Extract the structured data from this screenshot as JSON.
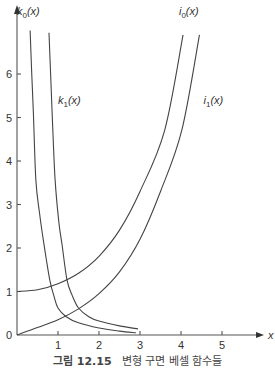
{
  "chart_data": {
    "type": "line",
    "title": "",
    "xlabel": "x",
    "ylabel": "",
    "xlim": [
      0,
      5.9
    ],
    "ylim": [
      0,
      7.2
    ],
    "grid": false,
    "legend": "inline labels",
    "x_ticks": [
      "1",
      "2",
      "3",
      "4",
      "5"
    ],
    "y_ticks": [
      "0",
      "1",
      "2",
      "3",
      "4",
      "5",
      "6"
    ],
    "series": [
      {
        "name": "k0(x)",
        "label_main": "k",
        "label_sub": "0",
        "label_arg": "(x)",
        "points": [
          [
            0.32,
            7.0
          ],
          [
            0.36,
            6.0
          ],
          [
            0.4,
            5.1
          ],
          [
            0.46,
            3.56
          ],
          [
            0.55,
            2.8
          ],
          [
            0.66,
            2.07
          ],
          [
            0.8,
            1.26
          ],
          [
            0.9,
            0.9
          ],
          [
            1.0,
            0.62
          ],
          [
            1.2,
            0.42
          ],
          [
            1.5,
            0.28
          ],
          [
            2.0,
            0.16
          ],
          [
            2.5,
            0.09
          ],
          [
            2.9,
            0.05
          ]
        ]
      },
      {
        "name": "k1(x)",
        "label_main": "k",
        "label_sub": "1",
        "label_arg": "(x)",
        "points": [
          [
            0.78,
            6.95
          ],
          [
            0.82,
            6.0
          ],
          [
            0.87,
            4.8
          ],
          [
            0.93,
            3.56
          ],
          [
            1.02,
            2.6
          ],
          [
            1.1,
            2.07
          ],
          [
            1.22,
            1.26
          ],
          [
            1.35,
            0.9
          ],
          [
            1.5,
            0.62
          ],
          [
            1.75,
            0.42
          ],
          [
            2.0,
            0.32
          ],
          [
            2.5,
            0.21
          ],
          [
            2.95,
            0.14
          ]
        ]
      },
      {
        "name": "i0(x)",
        "label_main": "i",
        "label_sub": "0",
        "label_arg": "(x)",
        "points": [
          [
            0.0,
            1.0
          ],
          [
            0.5,
            1.04
          ],
          [
            1.0,
            1.18
          ],
          [
            1.5,
            1.42
          ],
          [
            2.0,
            1.81
          ],
          [
            2.5,
            2.41
          ],
          [
            3.0,
            3.3
          ],
          [
            3.6,
            4.7
          ],
          [
            4.05,
            6.9
          ]
        ]
      },
      {
        "name": "i1(x)",
        "label_main": "i",
        "label_sub": "1",
        "label_arg": "(x)",
        "points": [
          [
            0.0,
            0.0
          ],
          [
            0.5,
            0.17
          ],
          [
            1.0,
            0.35
          ],
          [
            1.5,
            0.6
          ],
          [
            2.0,
            0.95
          ],
          [
            2.5,
            1.45
          ],
          [
            3.0,
            2.2
          ],
          [
            3.5,
            3.3
          ],
          [
            4.02,
            4.71
          ],
          [
            4.45,
            6.9
          ]
        ]
      }
    ],
    "label_positions": [
      {
        "series": "k0(x)",
        "x": 0.0,
        "y": 7.35
      },
      {
        "series": "k1(x)",
        "x": 1.0,
        "y": 5.3
      },
      {
        "series": "i0(x)",
        "x": 3.95,
        "y": 7.35
      },
      {
        "series": "i1(x)",
        "x": 4.55,
        "y": 5.3
      }
    ]
  },
  "caption": {
    "figure_number": "그림 12.15",
    "text": "변형 구면 베셀 함수들"
  }
}
